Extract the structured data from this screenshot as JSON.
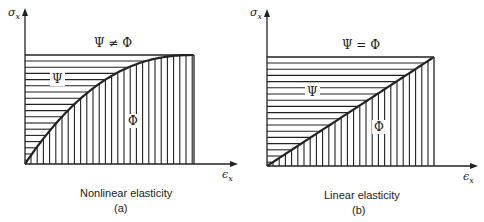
{
  "panels": [
    {
      "id": "a",
      "caption": "Nonlinear elasticity",
      "sub_label": "(a)",
      "y_axis_label": "σ",
      "y_axis_sub": "x",
      "x_axis_label": "ϵ",
      "x_axis_sub": "x",
      "top_label": "Ψ ≠ Φ",
      "upper_region_label": "Ψ",
      "lower_region_label": "Φ",
      "curve": "nonlinear"
    },
    {
      "id": "b",
      "caption": "Linear elasticity",
      "sub_label": "(b)",
      "y_axis_label": "σ",
      "y_axis_sub": "x",
      "x_axis_label": "ϵ",
      "x_axis_sub": "x",
      "top_label": "Ψ = Φ",
      "upper_region_label": "Ψ",
      "lower_region_label": "Φ",
      "curve": "linear"
    }
  ],
  "colors": {
    "ink": "#222222",
    "background": "#ffffff"
  }
}
